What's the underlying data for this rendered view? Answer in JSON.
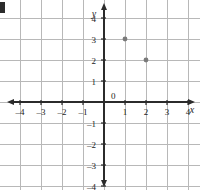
{
  "figure": {
    "kind": "coordinate-plane",
    "corner_mark": "",
    "axis_labels": {
      "x": "x",
      "y": "y",
      "origin": "0"
    }
  },
  "chart_data": {
    "type": "scatter",
    "title": "",
    "subtitle": "",
    "xlabel": "x",
    "ylabel": "y",
    "xlim": [
      -5,
      5
    ],
    "ylim": [
      -5,
      5
    ],
    "xticks": [
      -4,
      -3,
      -2,
      -1,
      1,
      2,
      3,
      4
    ],
    "yticks": [
      4,
      3,
      2,
      1,
      -1,
      -2,
      -3,
      -4
    ],
    "xtick_labels": [
      "–4",
      "–3",
      "–2",
      "–1",
      "1",
      "2",
      "3",
      "4"
    ],
    "ytick_labels": [
      "4",
      "3",
      "2",
      "1",
      "–1",
      "–2",
      "–3",
      "–4"
    ],
    "origin_label": "0",
    "grid": true,
    "grid_step": 1,
    "legend": "none",
    "axis_arrows": [
      "left",
      "right",
      "up",
      "down"
    ],
    "points": [
      {
        "x": 1,
        "y": 3,
        "label": ""
      },
      {
        "x": 2,
        "y": 2,
        "label": ""
      }
    ],
    "colors": {
      "grid": "#b8b8b8",
      "axis": "#2b2b2b",
      "point": "#7a7a7a",
      "label": "#1c1c1c",
      "background": "#ffffff"
    }
  }
}
